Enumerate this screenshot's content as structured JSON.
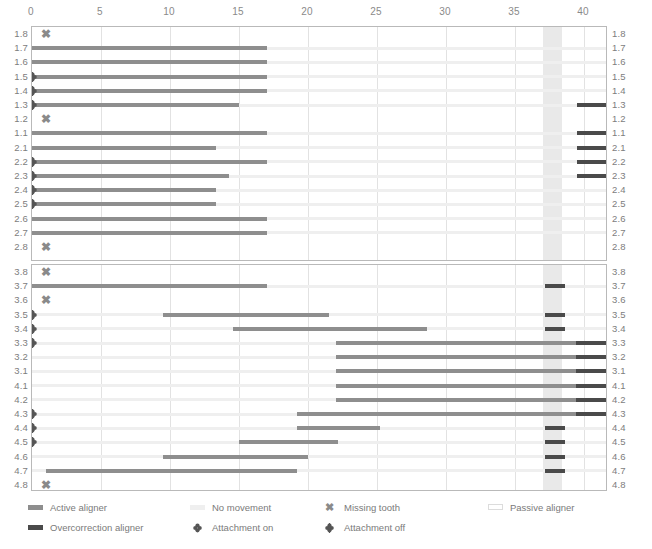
{
  "chart_data": {
    "type": "bar",
    "title": "",
    "xlabel": "",
    "ylabel": "",
    "xlim": [
      0,
      41.7
    ],
    "ticks": [
      0,
      5,
      10,
      15,
      20,
      25,
      30,
      35,
      40
    ],
    "grid": true,
    "passive_aligner_band": {
      "start": 37.0,
      "end": 38.4
    },
    "panels": [
      {
        "name": "upper-arch",
        "rows": [
          {
            "label": "1.8",
            "missing": true,
            "attachment": null,
            "segments": []
          },
          {
            "label": "1.7",
            "missing": false,
            "attachment": null,
            "segments": [
              {
                "type": "active",
                "start": 0,
                "end": 17
              }
            ]
          },
          {
            "label": "1.6",
            "missing": false,
            "attachment": null,
            "segments": [
              {
                "type": "active",
                "start": 0,
                "end": 17
              }
            ]
          },
          {
            "label": "1.5",
            "missing": false,
            "attachment": "off",
            "segments": [
              {
                "type": "active",
                "start": 0,
                "end": 17
              }
            ]
          },
          {
            "label": "1.4",
            "missing": false,
            "attachment": "off",
            "segments": [
              {
                "type": "active",
                "start": 0,
                "end": 17
              }
            ]
          },
          {
            "label": "1.3",
            "missing": false,
            "attachment": "off",
            "segments": [
              {
                "type": "active",
                "start": 0,
                "end": 15
              },
              {
                "type": "over",
                "start": 39.5,
                "end": 41.7
              }
            ]
          },
          {
            "label": "1.2",
            "missing": true,
            "attachment": null,
            "segments": []
          },
          {
            "label": "1.1",
            "missing": false,
            "attachment": null,
            "segments": [
              {
                "type": "active",
                "start": 0,
                "end": 17
              },
              {
                "type": "over",
                "start": 39.5,
                "end": 41.7
              }
            ]
          },
          {
            "label": "2.1",
            "missing": false,
            "attachment": null,
            "segments": [
              {
                "type": "active",
                "start": 0,
                "end": 13.3
              },
              {
                "type": "over",
                "start": 39.5,
                "end": 41.7
              }
            ]
          },
          {
            "label": "2.2",
            "missing": false,
            "attachment": "off",
            "segments": [
              {
                "type": "active",
                "start": 0,
                "end": 17
              },
              {
                "type": "over",
                "start": 39.5,
                "end": 41.7
              }
            ]
          },
          {
            "label": "2.3",
            "missing": false,
            "attachment": "off",
            "segments": [
              {
                "type": "active",
                "start": 0,
                "end": 14.3
              },
              {
                "type": "over",
                "start": 39.5,
                "end": 41.7
              }
            ]
          },
          {
            "label": "2.4",
            "missing": false,
            "attachment": "off",
            "segments": [
              {
                "type": "active",
                "start": 0,
                "end": 13.3
              }
            ]
          },
          {
            "label": "2.5",
            "missing": false,
            "attachment": "off",
            "segments": [
              {
                "type": "active",
                "start": 0,
                "end": 13.3
              }
            ]
          },
          {
            "label": "2.6",
            "missing": false,
            "attachment": null,
            "segments": [
              {
                "type": "active",
                "start": 0,
                "end": 17
              }
            ]
          },
          {
            "label": "2.7",
            "missing": false,
            "attachment": null,
            "segments": [
              {
                "type": "active",
                "start": 0,
                "end": 17
              }
            ]
          },
          {
            "label": "2.8",
            "missing": true,
            "attachment": null,
            "segments": []
          }
        ]
      },
      {
        "name": "lower-arch",
        "rows": [
          {
            "label": "3.8",
            "missing": true,
            "attachment": null,
            "segments": []
          },
          {
            "label": "3.7",
            "missing": false,
            "attachment": null,
            "segments": [
              {
                "type": "active",
                "start": 0,
                "end": 17
              },
              {
                "type": "over",
                "start": 37.2,
                "end": 38.6
              }
            ]
          },
          {
            "label": "3.6",
            "missing": true,
            "attachment": null,
            "segments": []
          },
          {
            "label": "3.5",
            "missing": false,
            "attachment": "off",
            "segments": [
              {
                "type": "active",
                "start": 9.5,
                "end": 21.5
              },
              {
                "type": "over",
                "start": 37.2,
                "end": 38.6
              }
            ]
          },
          {
            "label": "3.4",
            "missing": false,
            "attachment": "off",
            "segments": [
              {
                "type": "active",
                "start": 14.6,
                "end": 28.6
              },
              {
                "type": "over",
                "start": 37.2,
                "end": 38.6
              }
            ]
          },
          {
            "label": "3.3",
            "missing": false,
            "attachment": "off",
            "segments": [
              {
                "type": "active",
                "start": 22.0,
                "end": 39.4
              },
              {
                "type": "over",
                "start": 39.4,
                "end": 41.7
              }
            ]
          },
          {
            "label": "3.2",
            "missing": false,
            "attachment": null,
            "segments": [
              {
                "type": "active",
                "start": 22.0,
                "end": 39.4
              },
              {
                "type": "over",
                "start": 39.4,
                "end": 41.7
              }
            ]
          },
          {
            "label": "3.1",
            "missing": false,
            "attachment": null,
            "segments": [
              {
                "type": "active",
                "start": 22.0,
                "end": 39.4
              },
              {
                "type": "over",
                "start": 39.4,
                "end": 41.7
              }
            ]
          },
          {
            "label": "4.1",
            "missing": false,
            "attachment": null,
            "segments": [
              {
                "type": "active",
                "start": 22.0,
                "end": 39.4
              },
              {
                "type": "over",
                "start": 39.4,
                "end": 41.7
              }
            ]
          },
          {
            "label": "4.2",
            "missing": false,
            "attachment": null,
            "segments": [
              {
                "type": "active",
                "start": 22.0,
                "end": 39.4
              },
              {
                "type": "over",
                "start": 39.4,
                "end": 41.7
              }
            ]
          },
          {
            "label": "4.3",
            "missing": false,
            "attachment": "off",
            "segments": [
              {
                "type": "active",
                "start": 19.2,
                "end": 39.4
              },
              {
                "type": "over",
                "start": 39.4,
                "end": 41.7
              }
            ]
          },
          {
            "label": "4.4",
            "missing": false,
            "attachment": "off",
            "segments": [
              {
                "type": "active",
                "start": 19.2,
                "end": 25.2
              },
              {
                "type": "over",
                "start": 37.2,
                "end": 38.6
              }
            ]
          },
          {
            "label": "4.5",
            "missing": false,
            "attachment": "off",
            "segments": [
              {
                "type": "active",
                "start": 15.0,
                "end": 22.2
              },
              {
                "type": "over",
                "start": 37.2,
                "end": 38.6
              }
            ]
          },
          {
            "label": "4.6",
            "missing": false,
            "attachment": null,
            "segments": [
              {
                "type": "active",
                "start": 9.5,
                "end": 20.0
              },
              {
                "type": "over",
                "start": 37.2,
                "end": 38.6
              }
            ]
          },
          {
            "label": "4.7",
            "missing": false,
            "attachment": null,
            "segments": [
              {
                "type": "active",
                "start": 1.0,
                "end": 19.2
              },
              {
                "type": "over",
                "start": 37.2,
                "end": 38.6
              }
            ]
          },
          {
            "label": "4.8",
            "missing": true,
            "attachment": null,
            "segments": []
          }
        ]
      }
    ]
  },
  "colors": {
    "active_aligner": "#8e8e8e",
    "overcorrection_aligner": "#4a4a4a",
    "no_movement": "#efefef",
    "passive_aligner": "#e9e9e9",
    "grid": "#e2e2e2",
    "border": "#b9b9b9",
    "text": "#7a7a7a"
  },
  "legend": {
    "items": [
      {
        "key": "active",
        "icon": "bar-active-icon",
        "label": "Active aligner"
      },
      {
        "key": "nomove",
        "icon": "bar-no-movement-icon",
        "label": "No movement"
      },
      {
        "key": "missing",
        "icon": "missing-tooth-icon",
        "label": "Missing tooth"
      },
      {
        "key": "passive",
        "icon": "bar-passive-icon",
        "label": "Passive aligner"
      },
      {
        "key": "over",
        "icon": "bar-overcorrection-icon",
        "label": "Overcorrection aligner"
      },
      {
        "key": "att_on",
        "icon": "attachment-on-icon",
        "label": "Attachment on"
      },
      {
        "key": "att_off",
        "icon": "attachment-off-icon",
        "label": "Attachment off"
      }
    ]
  },
  "markers": {
    "missing_glyph": "✖"
  }
}
